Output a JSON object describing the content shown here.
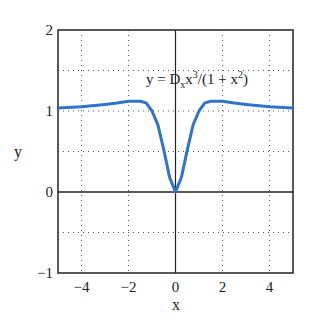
{
  "chart_data": {
    "type": "line",
    "title": "",
    "annotation": "y = D_x x^3/(1 + x^2)",
    "annotation_parts": {
      "a": "y = D",
      "sub": "x",
      "b": "x",
      "sup1": "3",
      "c": "/(1 + x",
      "sup2": "2",
      "d": ")"
    },
    "xlabel": "x",
    "ylabel": "y",
    "xlim": [
      -5,
      5
    ],
    "ylim": [
      -1,
      2
    ],
    "grid": true,
    "xticks": [
      "−4",
      "−2",
      "0",
      "2",
      "4"
    ],
    "yticks": [
      "−1",
      "0",
      "1",
      "2"
    ],
    "series": [
      {
        "name": "y = D_x x^3/(1+x^2)",
        "color": "#2f74c9",
        "x": [
          -5,
          -4,
          -3,
          -2.5,
          -2,
          -1.5,
          -1.25,
          -1,
          -0.75,
          -0.5,
          -0.25,
          0,
          0.25,
          0.5,
          0.75,
          1,
          1.25,
          1.5,
          2,
          2.5,
          3,
          4,
          5
        ],
        "y": [
          1.036,
          1.052,
          1.08,
          1.098,
          1.12,
          1.12,
          1.1,
          1.0,
          0.83,
          0.52,
          0.18,
          0,
          0.18,
          0.52,
          0.83,
          1.0,
          1.1,
          1.12,
          1.12,
          1.098,
          1.08,
          1.052,
          1.036
        ]
      }
    ]
  }
}
